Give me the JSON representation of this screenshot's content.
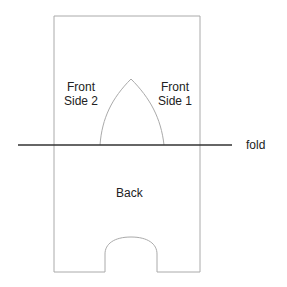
{
  "diagram": {
    "labels": {
      "front_side_2_line1": "Front",
      "front_side_2_line2": "Side 2",
      "front_side_1_line1": "Front",
      "front_side_1_line2": "Side 1",
      "fold": "fold",
      "back": "Back"
    },
    "colors": {
      "outline": "#aaaaaa",
      "fold_line": "#333333",
      "text": "#222222"
    }
  }
}
